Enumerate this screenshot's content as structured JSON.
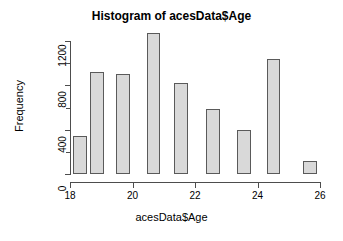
{
  "chart_data": {
    "type": "bar",
    "title": "Histogram of acesData$Age",
    "xlabel": "acesData$Age",
    "ylabel": "Frequency",
    "xlim": [
      18,
      26
    ],
    "ylim": [
      0,
      1300
    ],
    "xticks": [
      "18",
      "20",
      "22",
      "24",
      "26"
    ],
    "xtick_values": [
      18,
      20,
      22,
      24,
      26
    ],
    "yticks": [
      "0",
      "400",
      "800",
      "1200"
    ],
    "ytick_values": [
      0,
      400,
      800,
      1200
    ],
    "grid": false,
    "legend": false,
    "bin_width": 0.44,
    "bins": [
      {
        "left": 18.1,
        "right": 18.54,
        "value": 345
      },
      {
        "left": 18.64,
        "right": 19.08,
        "value": 920
      },
      {
        "left": 19.48,
        "right": 19.92,
        "value": 900
      },
      {
        "left": 20.45,
        "right": 20.89,
        "value": 1270
      },
      {
        "left": 21.32,
        "right": 21.76,
        "value": 825
      },
      {
        "left": 22.35,
        "right": 22.79,
        "value": 590
      },
      {
        "left": 23.35,
        "right": 23.79,
        "value": 395
      },
      {
        "left": 24.29,
        "right": 24.73,
        "value": 1035
      },
      {
        "left": 25.45,
        "right": 25.89,
        "value": 115
      }
    ],
    "categories": [
      "18.1-18.5",
      "18.6-19.1",
      "19.5-19.9",
      "20.5-20.9",
      "21.3-21.8",
      "22.4-22.8",
      "23.4-23.8",
      "24.3-24.7",
      "25.5-25.9"
    ],
    "values": [
      345,
      920,
      900,
      1270,
      825,
      590,
      395,
      1035,
      115
    ],
    "bar_fill": "#d9d9d9",
    "bar_border": "#5a5a5a",
    "axis_color": "#4d4d4d",
    "background": "#ffffff"
  }
}
